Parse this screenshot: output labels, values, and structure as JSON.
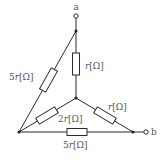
{
  "diagram": {
    "type": "resistor-network",
    "terminals": [
      {
        "id": "a",
        "label": "a"
      },
      {
        "id": "b",
        "label": "b"
      }
    ],
    "resistors": [
      {
        "id": "top-vertical",
        "label": "r[Ω]",
        "coef": "",
        "var": "r",
        "unit": "[Ω]"
      },
      {
        "id": "left-diagonal",
        "label": "5r[Ω]",
        "coef": "5",
        "var": "r",
        "unit": "[Ω]"
      },
      {
        "id": "center-left",
        "label": "2r[Ω]",
        "coef": "2",
        "var": "r",
        "unit": "[Ω]"
      },
      {
        "id": "center-right",
        "label": "r[Ω]",
        "coef": "",
        "var": "r",
        "unit": "[Ω]"
      },
      {
        "id": "bottom",
        "label": "5r[Ω]",
        "coef": "5",
        "var": "r",
        "unit": "[Ω]"
      }
    ]
  },
  "colors": {
    "line": "#2a2a2a",
    "text": "#555555",
    "background": "#ffffff"
  }
}
